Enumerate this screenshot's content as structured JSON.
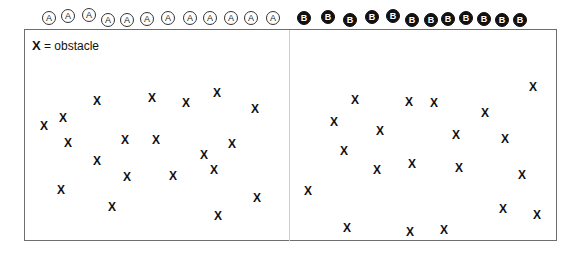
{
  "legend": {
    "symbol": "X",
    "text": " = obstacle"
  },
  "colors": {
    "border": "#6e6e6e",
    "divider": "#cfcfcf",
    "agent_b_fill": "#111111",
    "agent_a_fill": "#ffffff"
  },
  "agents_a": {
    "label": "A",
    "positions": [
      [
        49,
        18
      ],
      [
        68,
        16
      ],
      [
        89,
        15
      ],
      [
        108,
        20
      ],
      [
        127,
        20
      ],
      [
        147,
        19
      ],
      [
        168,
        18
      ],
      [
        190,
        18
      ],
      [
        210,
        18
      ],
      [
        231,
        18
      ],
      [
        251,
        18
      ],
      [
        273,
        18
      ]
    ]
  },
  "agents_b": {
    "label": "B",
    "positions": [
      [
        304,
        18
      ],
      [
        328,
        17
      ],
      [
        350,
        20
      ],
      [
        372,
        17
      ],
      [
        393,
        16
      ],
      [
        412,
        20
      ],
      [
        431,
        20
      ],
      [
        448,
        19
      ],
      [
        466,
        18
      ],
      [
        484,
        19
      ],
      [
        502,
        20
      ],
      [
        520,
        20
      ]
    ]
  },
  "obstacles_left": [
    [
      44,
      126
    ],
    [
      63,
      118
    ],
    [
      97,
      101
    ],
    [
      152,
      98
    ],
    [
      186,
      103
    ],
    [
      217,
      93
    ],
    [
      255,
      109
    ],
    [
      68,
      143
    ],
    [
      125,
      140
    ],
    [
      156,
      140
    ],
    [
      232,
      144
    ],
    [
      204,
      155
    ],
    [
      97,
      161
    ],
    [
      214,
      170
    ],
    [
      127,
      177
    ],
    [
      173,
      176
    ],
    [
      61,
      190
    ],
    [
      112,
      207
    ],
    [
      218,
      216
    ],
    [
      257,
      198
    ]
  ],
  "obstacles_right": [
    [
      355,
      100
    ],
    [
      409,
      102
    ],
    [
      434,
      103
    ],
    [
      485,
      113
    ],
    [
      533,
      87
    ],
    [
      334,
      122
    ],
    [
      380,
      131
    ],
    [
      456,
      135
    ],
    [
      505,
      139
    ],
    [
      344,
      151
    ],
    [
      377,
      170
    ],
    [
      412,
      164
    ],
    [
      459,
      168
    ],
    [
      522,
      175
    ],
    [
      308,
      191
    ],
    [
      503,
      209
    ],
    [
      537,
      215
    ],
    [
      347,
      228
    ],
    [
      410,
      232
    ],
    [
      444,
      230
    ]
  ]
}
